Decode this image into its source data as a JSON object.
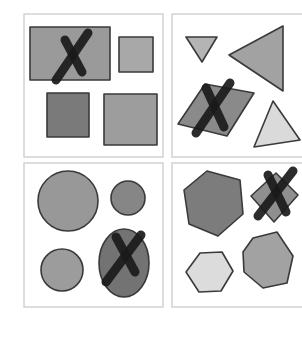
{
  "figure": {
    "colors": {
      "background": "#ffffff",
      "panel_border": "#cfcfcf",
      "outline": "#3a3a3a",
      "cross": "#1a1a1a",
      "light_gray": "#d8d8d8",
      "medium_gray": "#a3a3a3",
      "mid_dark_gray": "#8e8e8e",
      "dark_gray": "#767676"
    },
    "panels": [
      {
        "id": "top-left",
        "theme": "rectangles",
        "frame": {
          "x": 24,
          "y": 14,
          "w": 139,
          "h": 143
        },
        "shapes": [
          {
            "name": "large-rectangle",
            "kind": "rect",
            "x": 30,
            "y": 27,
            "w": 80,
            "h": 53,
            "fill": "#9a9a9a",
            "crossed": true
          },
          {
            "name": "small-square",
            "kind": "rect",
            "x": 119,
            "y": 37,
            "w": 34,
            "h": 35,
            "fill": "#a8a8a8",
            "crossed": false
          },
          {
            "name": "dark-square",
            "kind": "rect",
            "x": 47,
            "y": 93,
            "w": 42,
            "h": 44,
            "fill": "#7a7a7a",
            "crossed": false
          },
          {
            "name": "medium-square",
            "kind": "rect",
            "x": 104,
            "y": 94,
            "w": 53,
            "h": 51,
            "fill": "#9d9d9d",
            "crossed": false
          }
        ],
        "cross": {
          "a": [
            [
              56,
              80
            ],
            [
              88,
              33
            ]
          ],
          "b": [
            [
              65,
              40
            ],
            [
              82,
              72
            ]
          ]
        }
      },
      {
        "id": "top-right",
        "theme": "triangles",
        "frame": {
          "x": 172,
          "y": 14,
          "w": 132,
          "h": 143
        },
        "shapes": [
          {
            "name": "small-down-triangle",
            "kind": "polygon",
            "points": "186,37 217,37 202,62",
            "fill": "#b4b4b4",
            "crossed": false
          },
          {
            "name": "large-left-triangle",
            "kind": "polygon",
            "points": "229,55 283,26 283,91",
            "fill": "#a2a2a2",
            "crossed": false
          },
          {
            "name": "rhombus",
            "kind": "polygon",
            "points": "178,124 205,84 254,93 227,136",
            "fill": "#8a8a8a",
            "crossed": true
          },
          {
            "name": "light-triangle",
            "kind": "polygon",
            "points": "254,147 273,101 300,140",
            "fill": "#dadada",
            "crossed": false
          }
        ],
        "cross": {
          "a": [
            [
              196,
              133
            ],
            [
              230,
              83
            ]
          ],
          "b": [
            [
              206,
              88
            ],
            [
              224,
              127
            ]
          ]
        }
      },
      {
        "id": "bottom-left",
        "theme": "circles",
        "frame": {
          "x": 24,
          "y": 163,
          "w": 139,
          "h": 144
        },
        "shapes": [
          {
            "name": "large-circle",
            "kind": "ellipse",
            "cx": 68,
            "cy": 201,
            "rx": 30,
            "ry": 30,
            "fill": "#989898",
            "crossed": false
          },
          {
            "name": "small-circle",
            "kind": "ellipse",
            "cx": 128,
            "cy": 198,
            "rx": 17,
            "ry": 17,
            "fill": "#868686",
            "crossed": false
          },
          {
            "name": "medium-circle",
            "kind": "ellipse",
            "cx": 62,
            "cy": 270,
            "rx": 21,
            "ry": 21,
            "fill": "#9c9c9c",
            "crossed": false
          },
          {
            "name": "ellipse",
            "kind": "ellipse",
            "cx": 124,
            "cy": 263,
            "rx": 25,
            "ry": 34,
            "fill": "#737373",
            "crossed": true
          }
        ],
        "cross": {
          "a": [
            [
              106,
              282
            ],
            [
              141,
              235
            ]
          ],
          "b": [
            [
              116,
              237
            ],
            [
              135,
              272
            ]
          ]
        }
      },
      {
        "id": "bottom-right",
        "theme": "hexagons",
        "frame": {
          "x": 172,
          "y": 163,
          "w": 132,
          "h": 144
        },
        "shapes": [
          {
            "name": "dark-hexagon",
            "kind": "polygon",
            "points": "184,190 207,171 240,180 243,214 218,236 189,224",
            "fill": "#7c7c7c",
            "crossed": false
          },
          {
            "name": "small-diamond",
            "kind": "polygon",
            "points": "251,196 276,173 298,195 274,222",
            "fill": "#8f8f8f",
            "crossed": true
          },
          {
            "name": "light-hexagon",
            "kind": "polygon",
            "points": "186,272 200,253 222,252 233,271 221,291 199,292",
            "fill": "#dcdcdc",
            "crossed": false
          },
          {
            "name": "medium-hexagon",
            "kind": "polygon",
            "points": "243,252 253,238 277,232 293,256 287,283 263,288 244,272",
            "fill": "#a2a2a2",
            "crossed": false
          }
        ],
        "cross": {
          "a": [
            [
              258,
              216
            ],
            [
              293,
              171
            ]
          ],
          "b": [
            [
              268,
              175
            ],
            [
              286,
              212
            ]
          ]
        }
      }
    ]
  }
}
